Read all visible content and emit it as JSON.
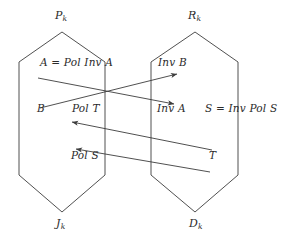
{
  "figure": {
    "stroke_color": "#3c3c3c",
    "background_color": "#ffffff"
  },
  "lattices": [
    {
      "name": "left-lattice",
      "top_label": "P",
      "top_sub": "k",
      "bottom_label": "J",
      "bottom_sub": "k"
    },
    {
      "name": "right-lattice",
      "top_label": "R",
      "top_sub": "k",
      "bottom_label": "D",
      "bottom_sub": "k"
    }
  ],
  "labels": {
    "left_top_corner": "P",
    "left_top_corner_sub": "k",
    "right_top_corner": "R",
    "right_top_corner_sub": "k",
    "left_bottom_corner": "J",
    "left_bottom_corner_sub": "k",
    "right_bottom_corner": "D",
    "right_bottom_corner_sub": "k",
    "a_pol_inv_a": "A = Pol Inv A",
    "inv_b": "Inv B",
    "b": "B",
    "pol_t": "Pol T",
    "inv_a": "Inv A",
    "s_inv_pol_s": "S = Inv Pol S",
    "pol_s": "Pol S",
    "t": "T"
  },
  "arrows": [
    {
      "name": "arrow-a-to-inv-a",
      "from_label": "A = Pol Inv A",
      "to_label": "Inv A",
      "direction": "left-to-right",
      "start": [
        38,
        78
      ],
      "end": [
        174,
        104
      ]
    },
    {
      "name": "arrow-b-to-inv-b",
      "from_label": "B",
      "to_label": "Inv B",
      "direction": "left-to-right",
      "start": [
        40,
        108
      ],
      "end": [
        177,
        74
      ]
    },
    {
      "name": "arrow-s-to-pol-s",
      "from_label": "S = Inv Pol S",
      "to_label": "Pol S",
      "direction": "right-to-left",
      "start": [
        213,
        150
      ],
      "end": [
        72,
        150
      ]
    },
    {
      "name": "arrow-t-to-pol-t",
      "from_label": "T",
      "to_label": "Pol T",
      "direction": "right-to-left",
      "start": [
        210,
        148
      ],
      "end": [
        70,
        122
      ]
    }
  ]
}
